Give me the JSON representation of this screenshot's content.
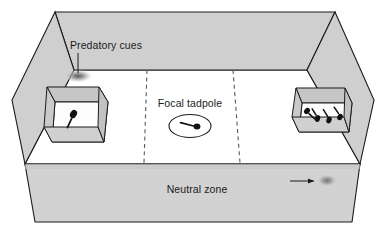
{
  "figure": {
    "kind": "experimental-apparatus-diagram",
    "title_visible": false
  },
  "labels": {
    "predatory_cues": "Predatory cues",
    "focal_tadpole": "Focal tadpole",
    "neutral_zone": "Neutral zone"
  },
  "annotations": {
    "predatory_cues_leader": {
      "text_anchor_x": 78,
      "text_anchor_y": 46,
      "line_from": [
        78,
        50
      ],
      "line_to": [
        78,
        74
      ],
      "target": "cue-plume-left"
    },
    "neutral_zone_arrow": {
      "from": [
        290,
        181
      ],
      "to": [
        318,
        181
      ],
      "target": "cue-plume-right",
      "direction": "right"
    }
  },
  "tank": {
    "open_top": true,
    "back_wall_label": "back-wall",
    "front_wall_label": "front-wall",
    "left_wall_label": "left-wall",
    "right_wall_label": "right-wall",
    "floor_label": "tank-floor"
  },
  "zones": {
    "count": 3,
    "names": [
      "predator-cue-zone-left",
      "neutral-centre-zone",
      "predator-cue-zone-right"
    ],
    "divider_style": "dashed",
    "dividers": [
      {
        "name": "zone-divider-left",
        "from": [
          147,
          70
        ],
        "to": [
          144,
          163
        ]
      },
      {
        "name": "zone-divider-right",
        "from": [
          233,
          70
        ],
        "to": [
          240,
          163
        ]
      }
    ]
  },
  "containers": [
    {
      "name": "stimulus-container-left",
      "side": "left",
      "open_top": true,
      "occupant_count": 1,
      "occupants": "tadpole"
    },
    {
      "name": "stimulus-container-right",
      "side": "right",
      "open_top": true,
      "occupant_count": 4,
      "occupants": "tadpoles"
    }
  ],
  "focal_animal": {
    "name": "focal-tadpole",
    "enclosure": "ellipse-ring",
    "facing": "right",
    "centre": [
      190,
      126
    ]
  },
  "cue_plumes": [
    {
      "name": "cue-plume-left",
      "centre": [
        78,
        76
      ],
      "rx": 13,
      "ry": 6
    },
    {
      "name": "cue-plume-right",
      "centre": [
        326,
        181
      ],
      "rx": 10,
      "ry": 6
    }
  ],
  "colors": {
    "wall_fill": "#cfcfcf",
    "wall_fill_light": "#d8d8d8",
    "floor_fill": "#ffffff",
    "outline": "#1b1b1b",
    "box_top_fill": "#c4c4c4",
    "box_inner_fill": "#fbfbfb",
    "animal_fill": "#111111",
    "plume_core": "#6d6d6d",
    "plume_edge": "#d6d6d6",
    "text": "#1b1b1b",
    "background": "#ffffff"
  }
}
